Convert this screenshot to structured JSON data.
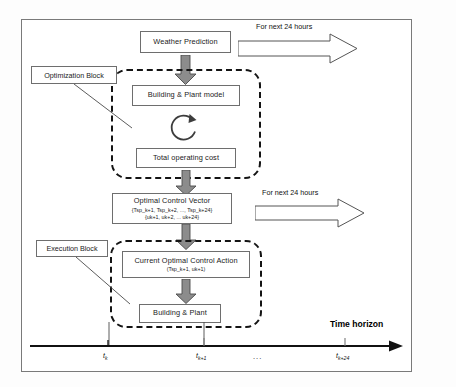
{
  "diagram": {
    "frame": {
      "border_color": "#7a7a7a"
    },
    "nodes": {
      "weather": {
        "label": "Weather Prediction"
      },
      "building_plant_model": {
        "label": "Building & Plant model"
      },
      "total_cost": {
        "label": "Total operating cost"
      },
      "optimal_control_vector": {
        "label": "Optimal Control Vector",
        "line2": "{Tsp_k+1, Tsp_k+2, ..., Tsp_k+24}",
        "line3": "{uk+1, uk+2, ... uk+24}"
      },
      "current_action": {
        "label": "Current Optimal Control Action",
        "line2": "(Tsp_k+1, uk+1)"
      },
      "building_plant": {
        "label": "Building & Plant"
      }
    },
    "groups": {
      "optimization_block": {
        "label": "Optimization Block"
      },
      "execution_block": {
        "label": "Execution Block"
      }
    },
    "annotations": {
      "horizon_top": "For next 24 hours",
      "horizon_mid": "For next 24 hours"
    },
    "axis": {
      "title": "Time horizon",
      "ticks": [
        {
          "label": "t",
          "sub": "k"
        },
        {
          "label": "t",
          "sub": "k+1"
        },
        {
          "label": "t",
          "sub": "k+24"
        }
      ],
      "ellipsis": "..."
    },
    "colors": {
      "arrow_fill": "#8c8c8c",
      "arrow_stroke": "#4a4a4a",
      "dashed_border": "#141414",
      "node_border": "#6e6e6e",
      "axis_color": "#111111"
    },
    "icons": {
      "down_arrow": "down-block-arrow",
      "right_arrow": "right-outline-arrow",
      "loop": "circular-iteration-arrow",
      "axis_arrow": "axis-arrow-right"
    }
  }
}
